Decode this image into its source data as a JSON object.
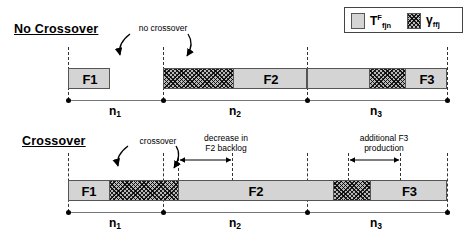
{
  "figure": {
    "panels": [
      {
        "id": "no-crossover",
        "title": "No Crossover",
        "annotation": "no crossover",
        "bar_labels": [
          "F1",
          "F2",
          "F3"
        ],
        "axis_labels": [
          "n",
          "n",
          "n"
        ],
        "axis_subs": [
          "1",
          "2",
          "3"
        ]
      },
      {
        "id": "crossover",
        "title": "Crossover",
        "annotation": "crossover",
        "annotation_2_line1": "decrease in",
        "annotation_2_line2": "F2 backlog",
        "annotation_3_line1": "additional F3",
        "annotation_3_line2": "production",
        "bar_labels": [
          "F1",
          "F2",
          "F3"
        ],
        "axis_labels": [
          "n",
          "n",
          "n"
        ],
        "axis_subs": [
          "1",
          "2",
          "3"
        ]
      }
    ],
    "legend": {
      "items": [
        {
          "swatch": "light-gray-box",
          "symbol": "T",
          "superscript": "F",
          "subscript": "fjn"
        },
        {
          "swatch": "hatched-box",
          "symbol": "γ",
          "superscript": "",
          "subscript": "ffj"
        }
      ]
    },
    "colors": {
      "fill_light": "#d4d4d4",
      "hatch_base": "#b9b9b9",
      "stroke": "#555555",
      "axis": "#777777",
      "text": "#000000"
    },
    "top_row_labels": {
      "f1": "F1",
      "f2": "F2",
      "f3": "F3"
    },
    "bottom_row_labels": {
      "f1": "F1",
      "f2": "F2",
      "f3": "F3"
    },
    "top_axis": {
      "n1": "n",
      "n1sub": "1",
      "n2": "n",
      "n2sub": "2",
      "n3": "n",
      "n3sub": "3"
    },
    "bottom_axis": {
      "n1": "n",
      "n1sub": "1",
      "n2": "n",
      "n2sub": "2",
      "n3": "n",
      "n3sub": "3"
    }
  }
}
